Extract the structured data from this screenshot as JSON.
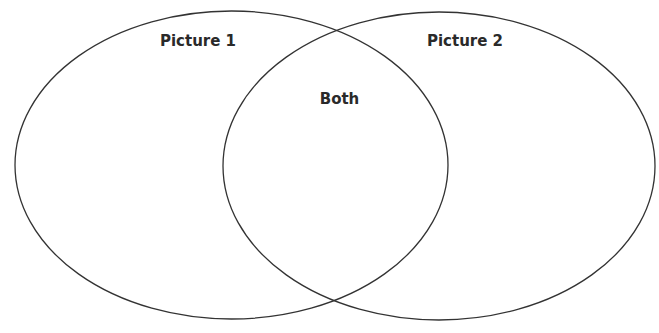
{
  "diagram": {
    "type": "venn",
    "stroke_color": "#333333",
    "background": "#ffffff",
    "sets": [
      {
        "label": "Picture 1",
        "cx": 231.5,
        "cy": 165,
        "rx": 216.5,
        "ry": 154
      },
      {
        "label": "Picture 2",
        "cx": 439,
        "cy": 166,
        "rx": 216,
        "ry": 154
      }
    ],
    "intersection": {
      "label": "Both"
    }
  }
}
